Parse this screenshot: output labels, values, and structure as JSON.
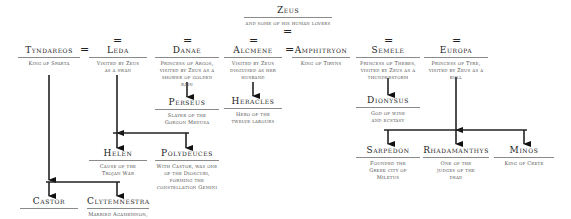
{
  "root": {
    "name": "Zeus",
    "desc": "and some of his human lovers"
  },
  "marriage_symbol": "=",
  "people": {
    "tyndareos": {
      "name": "Tyndareos",
      "desc": "King of Sparta"
    },
    "leda": {
      "name": "Leda",
      "desc": "Visited by Zeus as a swan"
    },
    "danae": {
      "name": "Danae",
      "desc": "Princess of Argos, visited by Zeus as a shower of golden rain"
    },
    "alcmene": {
      "name": "Alcmene",
      "desc": "Visited by Zeus disguised as her husband"
    },
    "amphitryon": {
      "name": "Amphitryon",
      "desc": "King of Tiryns"
    },
    "semele": {
      "name": "Semele",
      "desc": "Princess of Thebes, visited by Zeus as a thunderstorm"
    },
    "europa": {
      "name": "Europa",
      "desc": "Princess of Tyre, visited by Zeus as a bull"
    },
    "perseus": {
      "name": "Perseus",
      "desc": "Slayer of the Gorgon Medusa"
    },
    "heracles": {
      "name": "Heracles",
      "desc": "Hero of the twelve labours"
    },
    "dionysus": {
      "name": "Dionysus",
      "desc": "God of wine and ecstasy"
    },
    "helen": {
      "name": "Helen",
      "desc": "Cause of the Trojan War"
    },
    "polydeuces": {
      "name": "Polydeuces",
      "desc": "With Castor, was one of the Dioscuri, forming the constellation Gemini"
    },
    "castor": {
      "name": "Castor",
      "desc": ""
    },
    "clytemnestra": {
      "name": "Clytemnestra",
      "desc": "Married Agamemnon, King of Mycenae"
    },
    "sarpedon": {
      "name": "Sarpedon",
      "desc": "Founded the Greek city of Miletus"
    },
    "rhadamanthys": {
      "name": "Rhadamanthys",
      "desc": "One of the judges of the dead"
    },
    "minos": {
      "name": "Minos",
      "desc": "King of Crete"
    }
  }
}
